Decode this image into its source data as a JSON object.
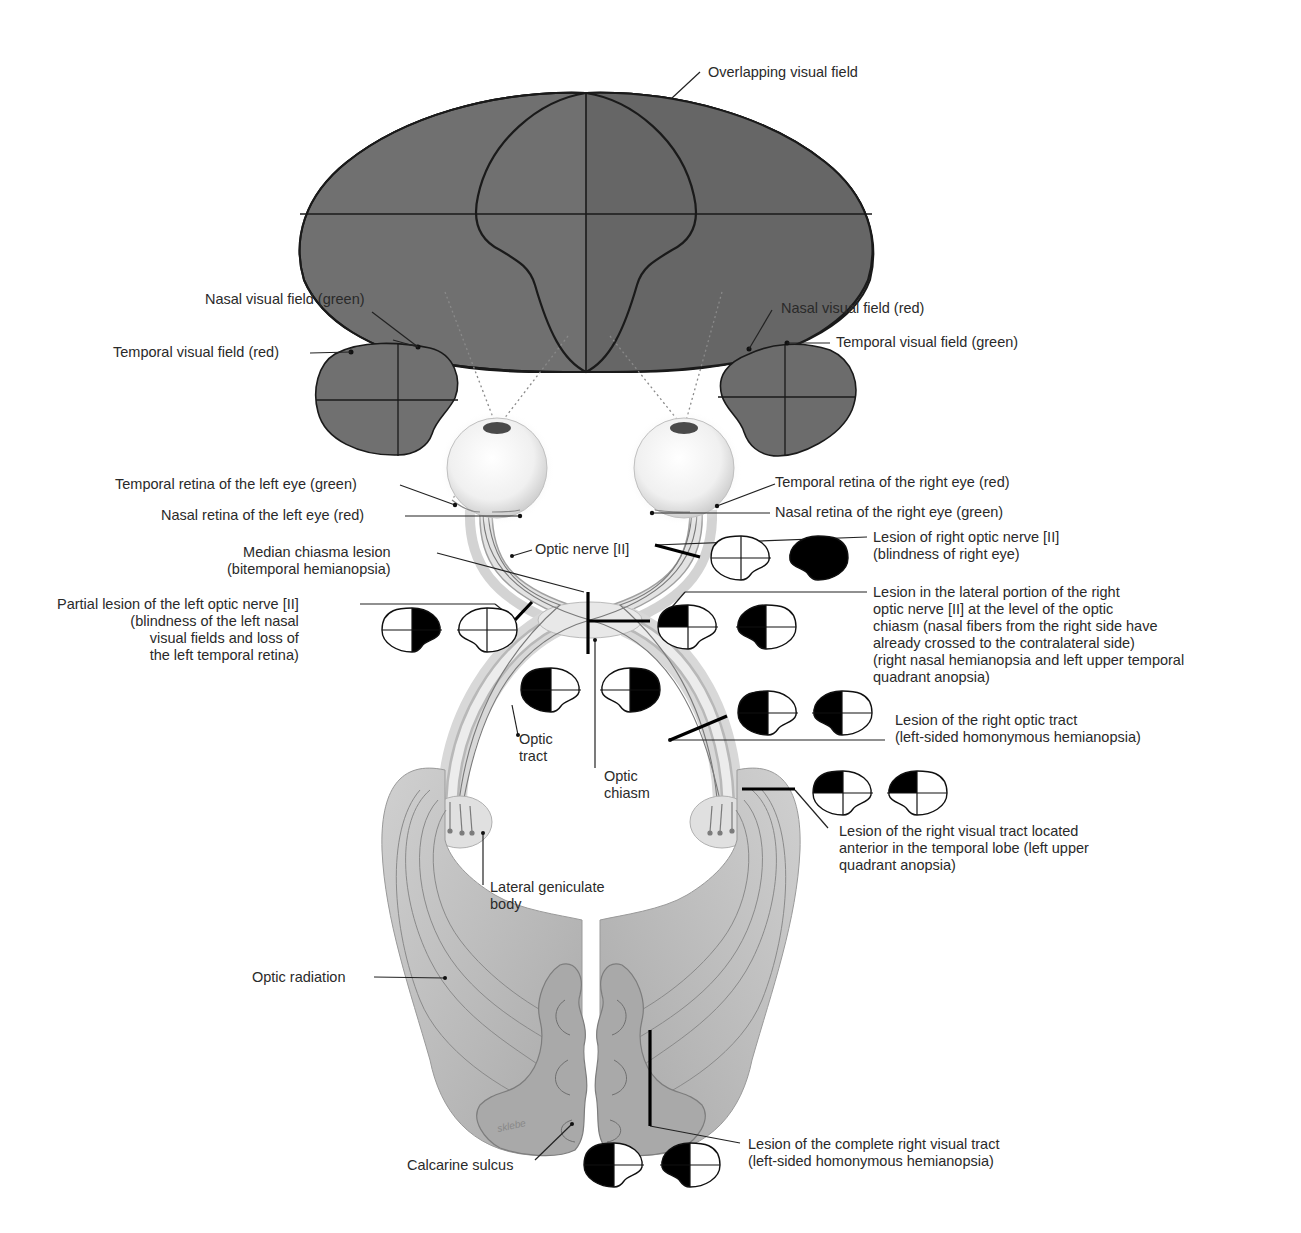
{
  "diagram": {
    "colors": {
      "field_fill": "#6f6f6f",
      "field_fill_dark": "#666666",
      "outline": "#1a1a1a",
      "nerve_fill": "#e4e4e4",
      "nerve_edge": "#9a9a9a",
      "brain_fill": "#b9b9b9",
      "brain_dark": "#8f8f8f",
      "blind": "#000000",
      "seeing": "#ffffff"
    },
    "labels": {
      "overlapping_field": "Overlapping visual field",
      "left_nasal_field": "Nasal visual field (green)",
      "left_temporal_field": "Temporal visual field (red)",
      "right_nasal_field": "Nasal visual field (red)",
      "right_temporal_field": "Temporal visual field (green)",
      "left_temporal_retina": "Temporal retina of the left eye (green)",
      "left_nasal_retina": "Nasal retina of the left eye (red)",
      "right_temporal_retina": "Temporal retina of the right eye (red)",
      "right_nasal_retina": "Nasal retina of the right eye (green)",
      "optic_nerve": "Optic nerve [II]",
      "median_chiasma_lesion": [
        "Median chiasma lesion",
        "(bitemporal hemianopsia)"
      ],
      "partial_left_nerve_lesion": [
        "Partial lesion of the left optic nerve [II]",
        "(blindness of the left nasal",
        "visual fields and loss of",
        "the left temporal retina)"
      ],
      "right_nerve_lesion": [
        "Lesion of right optic nerve [II]",
        "(blindness of right eye)"
      ],
      "lateral_right_nerve_lesion": [
        "Lesion in the lateral portion of the right",
        "optic nerve [II] at the level of the optic",
        "chiasm  (nasal fibers from the right side have",
        "already crossed to the contralateral side)",
        "(right nasal hemianopsia and left upper temporal",
        "quadrant anopsia)"
      ],
      "optic_tract": [
        "Optic",
        "tract"
      ],
      "optic_chiasm": [
        "Optic",
        "chiasm"
      ],
      "right_optic_tract_lesion": [
        "Lesion of the right optic tract",
        "(left-sided homonymous hemianopsia)"
      ],
      "temporal_lobe_lesion": [
        "Lesion of the right visual tract located",
        "anterior in the temporal lobe (left upper",
        "quadrant anopsia)"
      ],
      "lateral_geniculate_body": [
        "Lateral geniculate",
        "body"
      ],
      "optic_radiation": "Optic radiation",
      "calcarine_sulcus": "Calcarine sulcus",
      "complete_tract_lesion": [
        "Lesion of the complete right visual tract",
        "(left-sided homonymous hemianopsia)"
      ],
      "signature": "sklebe"
    },
    "field_defects": [
      {
        "lesion": "partial-left-optic-nerve",
        "left_eye": [
          "nasal"
        ],
        "right_eye": []
      },
      {
        "lesion": "right-optic-nerve",
        "left_eye": [],
        "right_eye": [
          "all"
        ]
      },
      {
        "lesion": "lateral-right-optic-nerve-at-chiasm",
        "left_eye": [
          "upper-temporal"
        ],
        "right_eye": [
          "nasal"
        ]
      },
      {
        "lesion": "median-chiasma",
        "left_eye": [
          "temporal"
        ],
        "right_eye": [
          "temporal"
        ]
      },
      {
        "lesion": "right-optic-tract",
        "left_eye": [
          "temporal"
        ],
        "right_eye": [
          "nasal"
        ]
      },
      {
        "lesion": "right-anterior-temporal-lobe",
        "left_eye": [
          "upper-temporal"
        ],
        "right_eye": [
          "upper-nasal"
        ]
      },
      {
        "lesion": "complete-right-visual-tract",
        "left_eye": [
          "temporal"
        ],
        "right_eye": [
          "nasal"
        ]
      }
    ]
  }
}
